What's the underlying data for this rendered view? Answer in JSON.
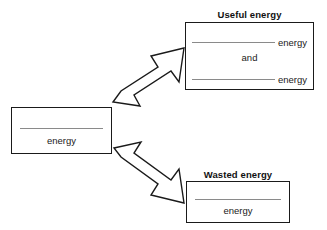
{
  "diagram": {
    "type": "energy-transfer-flow-chart",
    "input": {
      "blank_word": "energy",
      "blank_label": ""
    },
    "useful": {
      "heading": "Useful energy",
      "rows": [
        {
          "blank_label": "",
          "word": "energy"
        },
        {
          "conjunction": "and"
        },
        {
          "blank_label": "",
          "word": "energy"
        }
      ],
      "conjunction": "and",
      "word_1": "energy",
      "word_2": "energy"
    },
    "wasted": {
      "heading": "Wasted energy",
      "blank_word": "energy",
      "blank_label": ""
    },
    "arrows": [
      {
        "name": "arrow-to-useful",
        "direction": "up-right"
      },
      {
        "name": "arrow-to-wasted",
        "direction": "down-right"
      }
    ],
    "colors": {
      "box_border": "#1a1a1a",
      "blank_rule": "#8a8a8a",
      "text": "#1a1a1a",
      "background": "#ffffff"
    }
  }
}
